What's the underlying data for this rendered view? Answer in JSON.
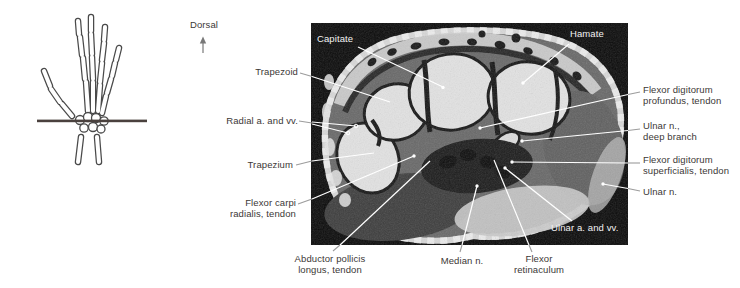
{
  "orientation": {
    "label": "Dorsal"
  },
  "mri_overlay_labels": {
    "capitate": "Capitate",
    "hamate": "Hamate",
    "ulnar_a_vv": "Ulnar a. and vv."
  },
  "left_labels": {
    "trapezoid": {
      "lines": [
        "Trapezoid"
      ]
    },
    "radial_a_vv": {
      "lines": [
        "Radial a. and vv."
      ]
    },
    "trapezium": {
      "lines": [
        "Trapezium"
      ]
    },
    "flexor_carpi_radialis": {
      "lines": [
        "Flexor carpi",
        "radialis, tendon"
      ]
    }
  },
  "bottom_labels": {
    "abductor_pollicis_longus": {
      "lines": [
        "Abductor pollicis",
        "longus, tendon"
      ]
    },
    "median_n": {
      "lines": [
        "Median n."
      ]
    },
    "flexor_retinaculum": {
      "lines": [
        "Flexor",
        "retinaculum"
      ]
    }
  },
  "right_labels": {
    "flexor_digitorum_profundus": {
      "lines": [
        "Flexor digitorum",
        "profundus, tendon"
      ]
    },
    "ulnar_n_deep_branch": {
      "lines": [
        "Ulnar n.,",
        "deep branch"
      ]
    },
    "flexor_digitorum_superficialis": {
      "lines": [
        "Flexor digitorum",
        "superficialis, tendon"
      ]
    },
    "ulnar_n": {
      "lines": [
        "Ulnar n."
      ]
    }
  },
  "colors": {
    "section_line": "#4a413e",
    "label_text": "#3c3836",
    "on_image_text": "#f2f2f2",
    "leader_line_outside": "#9c9c9c",
    "leader_line_inside": "#ffffff",
    "mri_background": "#0a0a0a"
  }
}
